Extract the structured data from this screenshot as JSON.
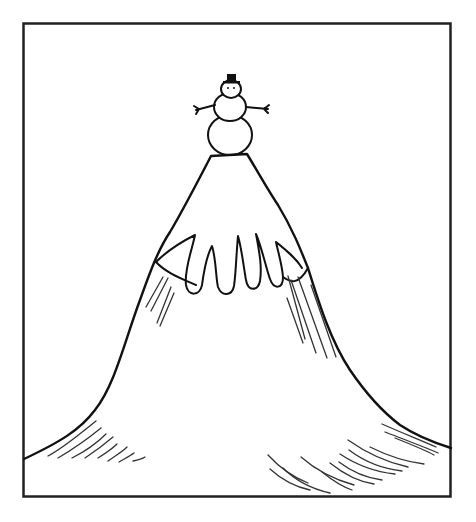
{
  "scene": {
    "description": "Cartoon line drawing of a snowman standing on the peak of a tall snow-capped mountain inside a rectangular frame",
    "colors": {
      "background": "#ffffff",
      "ink": "#111111",
      "hatch": "#333333",
      "hat": "#111111"
    },
    "frame": {
      "x": 23,
      "y": 23,
      "width": 428,
      "height": 474
    },
    "elements": [
      "frame",
      "mountain",
      "snow-cap",
      "snowman",
      "hat",
      "stick-arms",
      "shading-hatches"
    ]
  }
}
